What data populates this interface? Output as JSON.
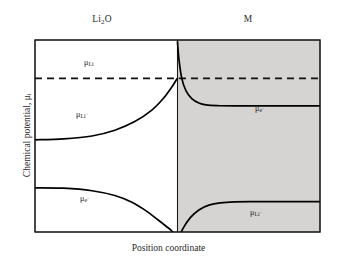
{
  "figure": {
    "top_labels": {
      "left_phase": "Li2O",
      "right_phase": "M"
    },
    "axis_labels": {
      "x": "Position coordinate",
      "y": "Chemical potential, μi"
    },
    "curve_labels": {
      "mu_li": "μLi",
      "mu_li_plus_left": "μLi+",
      "mu_e_minus_left": "μe−",
      "mu_e_minus_right": "μe−",
      "mu_li_plus_right": "μLi+"
    },
    "colors": {
      "shaded_region": "#d6d4d2",
      "frame": "#1a1a1a",
      "curve": "#000000",
      "background": "#ffffff"
    }
  },
  "chart_data": {
    "type": "line",
    "title": "",
    "xlabel": "Position coordinate",
    "ylabel": "Chemical potential, μi",
    "grid": false,
    "legend": "inline-annotations",
    "xlim": [
      0,
      1
    ],
    "ylim": [
      0,
      1
    ],
    "regions": [
      {
        "name": "Li2O",
        "x_range": [
          0.0,
          0.5
        ],
        "shaded": false,
        "label": "Li2O"
      },
      {
        "name": "M",
        "x_range": [
          0.5,
          1.0
        ],
        "shaded": true,
        "label": "M"
      }
    ],
    "interface_x": 0.5,
    "series": [
      {
        "name": "μLi",
        "style": "dashed",
        "description": "Constant chemical potential of neutral Li across both phases",
        "x": [
          0.0,
          1.0
        ],
        "y": [
          0.8,
          0.8
        ]
      },
      {
        "name": "μLi+ (Li2O side)",
        "style": "solid",
        "description": "Plateau in Li2O rising asymptotically to μLi at the interface",
        "x": [
          0.0,
          0.1,
          0.2,
          0.28,
          0.35,
          0.41,
          0.45,
          0.48,
          0.495,
          0.5
        ],
        "y": [
          0.48,
          0.485,
          0.5,
          0.53,
          0.575,
          0.635,
          0.695,
          0.755,
          0.79,
          0.8
        ]
      },
      {
        "name": "μe− (Li2O side)",
        "style": "solid",
        "description": "Plateau in Li2O falling steeply below the frame near the interface",
        "x": [
          0.0,
          0.1,
          0.2,
          0.28,
          0.34,
          0.39,
          0.43,
          0.46,
          0.48,
          0.495
        ],
        "y": [
          0.23,
          0.228,
          0.215,
          0.19,
          0.155,
          0.11,
          0.065,
          0.03,
          0.005,
          -0.03
        ]
      },
      {
        "name": "μe− (M side)",
        "style": "solid",
        "description": "Spike above μLi at the interface decaying to a plateau in M",
        "x": [
          0.5,
          0.505,
          0.515,
          0.53,
          0.55,
          0.575,
          0.6,
          0.64,
          0.7,
          1.0
        ],
        "y": [
          0.99,
          0.9,
          0.8,
          0.735,
          0.695,
          0.672,
          0.662,
          0.658,
          0.657,
          0.657
        ]
      },
      {
        "name": "μLi+ (M side)",
        "style": "solid",
        "description": "Rises from below the frame at the interface to a plateau in M",
        "x": [
          0.505,
          0.52,
          0.545,
          0.575,
          0.61,
          0.65,
          0.7,
          0.78,
          1.0
        ],
        "y": [
          -0.03,
          0.02,
          0.075,
          0.115,
          0.14,
          0.152,
          0.157,
          0.158,
          0.158
        ]
      }
    ]
  }
}
